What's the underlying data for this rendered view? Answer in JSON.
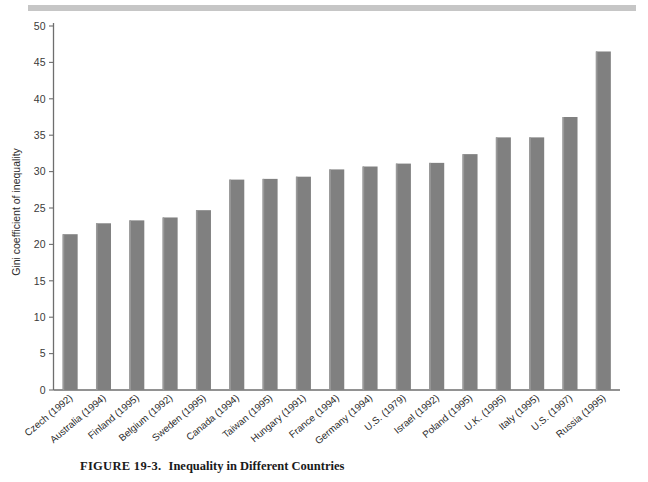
{
  "figure": {
    "caption_label": "FIGURE 19-3.",
    "caption_title": "Inequality in Different Countries",
    "top_rule_color": "#c6c6c6"
  },
  "chart_data": {
    "type": "bar",
    "title": "",
    "xlabel": "",
    "ylabel": "Gini coefficient of inequality",
    "ylim": [
      0,
      50
    ],
    "ytick_step": 5,
    "ytick_labels": [
      "0",
      "5",
      "10",
      "15",
      "20",
      "25",
      "30",
      "35",
      "40",
      "45",
      "50"
    ],
    "grid": false,
    "legend": "none",
    "bar_color": "#808080",
    "axis_color": "#6e6e6e",
    "categories": [
      "Czech (1992)",
      "Australia (1994)",
      "Finland (1995)",
      "Belgium (1992)",
      "Sweden (1995)",
      "Canada (1994)",
      "Taiwan (1995)",
      "Hungary (1991)",
      "France (1994)",
      "Germany (1994)",
      "U.S. (1979)",
      "Israel (1992)",
      "Poland (1995)",
      "U.K. (1995)",
      "Italy (1995)",
      "U.S. (1997)",
      "Russia (1995)"
    ],
    "values": [
      21.4,
      22.9,
      23.3,
      23.7,
      24.7,
      28.9,
      29.0,
      29.3,
      30.3,
      30.7,
      31.1,
      31.2,
      32.4,
      34.7,
      34.7,
      37.5,
      46.5
    ]
  }
}
